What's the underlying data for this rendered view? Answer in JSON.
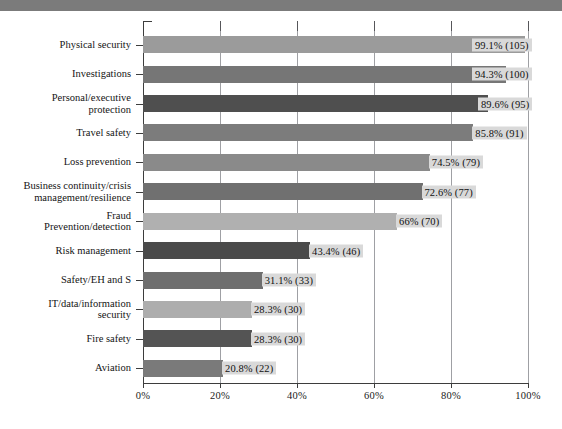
{
  "header": {
    "bar_color": "#7b7b7b"
  },
  "chart_data": {
    "type": "bar",
    "orientation": "horizontal",
    "title": "",
    "subtitle": "",
    "xlabel": "",
    "ylabel": "",
    "xlim": [
      0,
      100
    ],
    "grid": true,
    "legend": "none",
    "tick_labels": [
      "0%",
      "20%",
      "40%",
      "60%",
      "80%",
      "100%"
    ],
    "tick_values": [
      0,
      20,
      40,
      60,
      80,
      100
    ],
    "categories": [
      "Physical security",
      "Investigations",
      "Personal/executive\nprotection",
      "Travel safety",
      "Loss prevention",
      "Business continuity/crisis\nmanagement/resilience",
      "Fraud\nPrevention/detection",
      "Risk management",
      "Safety/EH and S",
      "IT/data/information\nsecurity",
      "Fire safety",
      "Aviation"
    ],
    "values": [
      99.1,
      94.3,
      89.6,
      85.8,
      74.5,
      72.6,
      66,
      43.4,
      31.1,
      28.3,
      28.3,
      20.8
    ],
    "counts": [
      105,
      100,
      95,
      91,
      79,
      77,
      70,
      46,
      33,
      30,
      30,
      22
    ],
    "data_labels": [
      "99.1% (105)",
      "94.3% (100)",
      "89.6% (95)",
      "85.8% (91)",
      "74.5% (79)",
      "72.6% (77)",
      "66% (70)",
      "43.4% (46)",
      "31.1% (33)",
      "28.3% (30)",
      "28.3% (30)",
      "20.8% (22)"
    ],
    "bar_colors": [
      "#9b9b9b",
      "#767676",
      "#4f4f4f",
      "#7c7c7c",
      "#8a8a8a",
      "#707070",
      "#b0b0b0",
      "#4a4a4a",
      "#6e6e6e",
      "#adadad",
      "#545454",
      "#7a7a7a"
    ]
  }
}
